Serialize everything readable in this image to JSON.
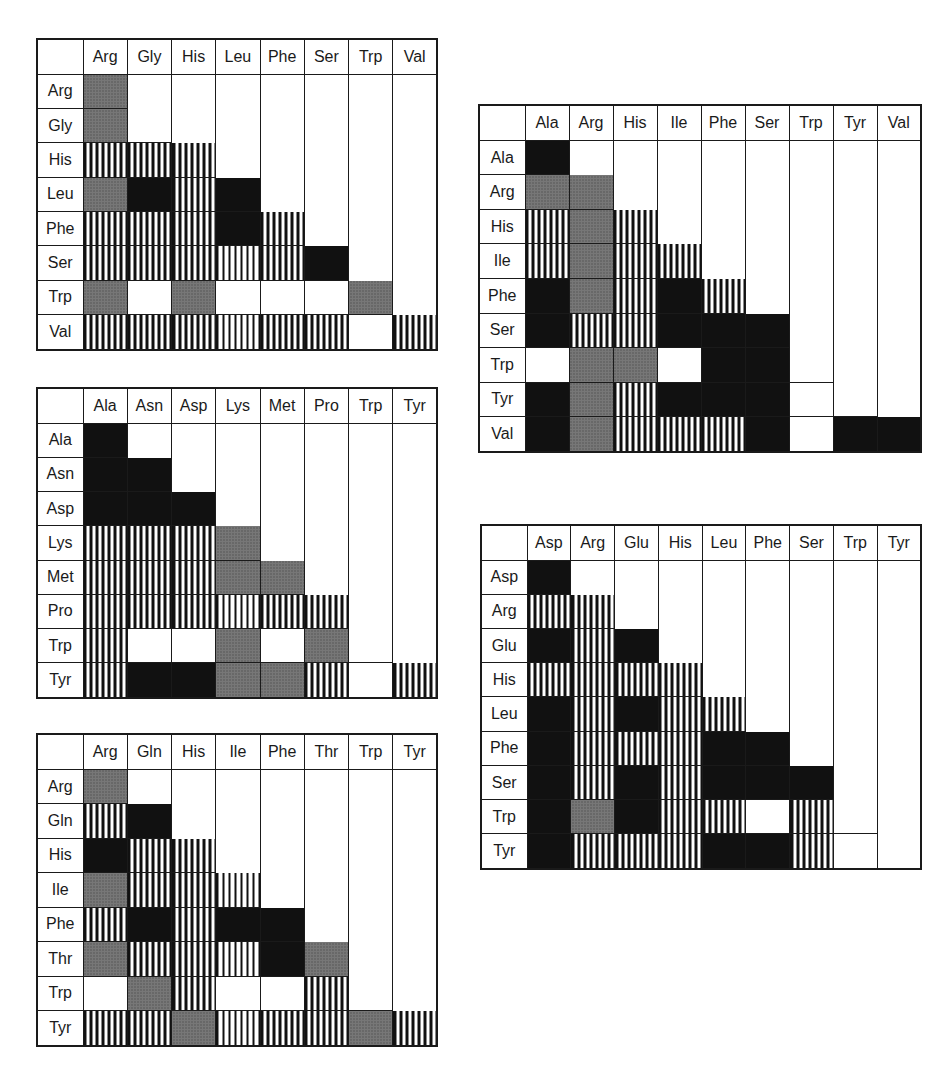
{
  "legend_codes": {
    "B": "solid black",
    "G": "gray stipple",
    "S": "vertical stripes",
    "W": "white (empty lower cell)",
    "N": "upper-triangle (no cell)"
  },
  "grids": [
    {
      "id": "grid-1",
      "columns": [
        "Arg",
        "Gly",
        "His",
        "Leu",
        "Phe",
        "Ser",
        "Trp",
        "Val"
      ],
      "rows": [
        "Arg",
        "Gly",
        "His",
        "Leu",
        "Phe",
        "Ser",
        "Trp",
        "Val"
      ],
      "cells": [
        [
          "G"
        ],
        [
          "G",
          "W"
        ],
        [
          "S",
          "S",
          "S"
        ],
        [
          "G",
          "B",
          "S",
          "B"
        ],
        [
          "S",
          "S",
          "S",
          "B",
          "S"
        ],
        [
          "S",
          "S",
          "S",
          "S",
          "S",
          "B"
        ],
        [
          "G",
          "W",
          "G",
          "W",
          "W",
          "W",
          "G"
        ],
        [
          "S",
          "S",
          "S",
          "S",
          "S",
          "S",
          "W",
          "S"
        ]
      ]
    },
    {
      "id": "grid-2",
      "columns": [
        "Ala",
        "Asn",
        "Asp",
        "Lys",
        "Met",
        "Pro",
        "Trp",
        "Tyr"
      ],
      "rows": [
        "Ala",
        "Asn",
        "Asp",
        "Lys",
        "Met",
        "Pro",
        "Trp",
        "Tyr"
      ],
      "cells": [
        [
          "B"
        ],
        [
          "B",
          "B"
        ],
        [
          "B",
          "B",
          "B"
        ],
        [
          "S",
          "S",
          "S",
          "G"
        ],
        [
          "S",
          "S",
          "S",
          "G",
          "G"
        ],
        [
          "S",
          "S",
          "S",
          "S",
          "S",
          "S"
        ],
        [
          "S",
          "W",
          "W",
          "G",
          "W",
          "G",
          "W"
        ],
        [
          "S",
          "B",
          "B",
          "G",
          "G",
          "S",
          "W",
          "S"
        ]
      ]
    },
    {
      "id": "grid-3",
      "columns": [
        "Arg",
        "Gln",
        "His",
        "Ile",
        "Phe",
        "Thr",
        "Trp",
        "Tyr"
      ],
      "rows": [
        "Arg",
        "Gln",
        "His",
        "Ile",
        "Phe",
        "Thr",
        "Trp",
        "Tyr"
      ],
      "cells": [
        [
          "G"
        ],
        [
          "S",
          "B"
        ],
        [
          "B",
          "S",
          "S"
        ],
        [
          "G",
          "S",
          "S",
          "S"
        ],
        [
          "S",
          "B",
          "S",
          "B",
          "B"
        ],
        [
          "G",
          "S",
          "S",
          "S",
          "B",
          "G"
        ],
        [
          "W",
          "G",
          "S",
          "W",
          "W",
          "S",
          "W"
        ],
        [
          "S",
          "S",
          "G",
          "S",
          "S",
          "S",
          "G",
          "S"
        ]
      ]
    },
    {
      "id": "grid-4",
      "columns": [
        "Ala",
        "Arg",
        "His",
        "Ile",
        "Phe",
        "Ser",
        "Trp",
        "Tyr",
        "Val"
      ],
      "rows": [
        "Ala",
        "Arg",
        "His",
        "Ile",
        "Phe",
        "Ser",
        "Trp",
        "Tyr",
        "Val"
      ],
      "cells": [
        [
          "B"
        ],
        [
          "G",
          "G"
        ],
        [
          "S",
          "G",
          "S"
        ],
        [
          "S",
          "G",
          "S",
          "S"
        ],
        [
          "B",
          "G",
          "S",
          "B",
          "S"
        ],
        [
          "B",
          "S",
          "S",
          "B",
          "B",
          "B"
        ],
        [
          "W",
          "G",
          "G",
          "W",
          "B",
          "B",
          "W"
        ],
        [
          "B",
          "G",
          "S",
          "B",
          "B",
          "B",
          "W",
          "W"
        ],
        [
          "B",
          "G",
          "S",
          "S",
          "S",
          "B",
          "W",
          "B",
          "B"
        ]
      ]
    },
    {
      "id": "grid-5",
      "columns": [
        "Asp",
        "Arg",
        "Glu",
        "His",
        "Leu",
        "Phe",
        "Ser",
        "Trp",
        "Tyr"
      ],
      "rows": [
        "Asp",
        "Arg",
        "Glu",
        "His",
        "Leu",
        "Phe",
        "Ser",
        "Trp",
        "Tyr"
      ],
      "cells": [
        [
          "B"
        ],
        [
          "S",
          "S"
        ],
        [
          "B",
          "S",
          "B"
        ],
        [
          "S",
          "S",
          "S",
          "S"
        ],
        [
          "B",
          "S",
          "B",
          "S",
          "S"
        ],
        [
          "B",
          "S",
          "S",
          "S",
          "B",
          "B"
        ],
        [
          "B",
          "S",
          "B",
          "S",
          "B",
          "B",
          "B"
        ],
        [
          "B",
          "G",
          "B",
          "S",
          "S",
          "W",
          "S",
          "W"
        ],
        [
          "B",
          "S",
          "S",
          "S",
          "B",
          "B",
          "S",
          "W",
          "W"
        ]
      ]
    }
  ],
  "layout": [
    {
      "grid": 0,
      "left": 36,
      "top": 38,
      "width": 400,
      "height": 313
    },
    {
      "grid": 1,
      "left": 36,
      "top": 387,
      "width": 400,
      "height": 312
    },
    {
      "grid": 2,
      "left": 36,
      "top": 733,
      "width": 400,
      "height": 314
    },
    {
      "grid": 3,
      "left": 478,
      "top": 104,
      "width": 442,
      "height": 349
    },
    {
      "grid": 4,
      "left": 480,
      "top": 524,
      "width": 440,
      "height": 346
    }
  ]
}
